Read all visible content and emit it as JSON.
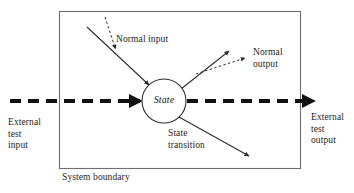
{
  "diagram": {
    "title_text_present": false,
    "colors": {
      "stroke": "#2b2b2b",
      "boundary_stroke": "#6f6f6f",
      "text": "#1d1d1d",
      "background": "#ffffff"
    },
    "boundary": {
      "label": "System boundary",
      "x": 59,
      "y": 11,
      "width": 241,
      "height": 157
    },
    "state_node": {
      "label": "State",
      "cx": 164,
      "cy": 101,
      "r": 22
    },
    "labels": {
      "normal_input": "Normal input",
      "normal_output": "Normal\noutput",
      "state_transition": "State\ntransition",
      "external_test_input": "External\ntest\ninput",
      "external_test_output": "External\ntest\noutput"
    },
    "edges": [
      {
        "name": "normal-input-solid",
        "style": "solid",
        "from": [
          87,
          27
        ],
        "to": [
          148,
          84
        ],
        "arrowhead": "filled-triangle"
      },
      {
        "name": "normal-input-dashed",
        "style": "dashed",
        "from": [
          105,
          18
        ],
        "to": [
          115,
          49
        ],
        "arrowhead": "filled-triangle"
      },
      {
        "name": "normal-output-solid",
        "style": "solid",
        "from": [
          182,
          88
        ],
        "to": [
          228,
          51
        ],
        "arrowhead": "filled-triangle"
      },
      {
        "name": "normal-output-dashed",
        "style": "dashed",
        "from": [
          197,
          73
        ],
        "to": [
          244,
          58
        ],
        "arrowhead": "filled-triangle"
      },
      {
        "name": "state-transition-solid",
        "style": "solid",
        "from": [
          179,
          118
        ],
        "to": [
          248,
          155
        ],
        "arrowhead": "filled-triangle"
      },
      {
        "name": "external-test-input-dashed",
        "style": "thick-dashed",
        "from": [
          10,
          101
        ],
        "to": [
          140,
          101
        ],
        "arrowhead": "filled-triangle"
      },
      {
        "name": "external-test-output-dashed",
        "style": "thick-dashed",
        "from": [
          187,
          101
        ],
        "to": [
          312,
          101
        ],
        "arrowhead": "filled-triangle"
      }
    ]
  }
}
